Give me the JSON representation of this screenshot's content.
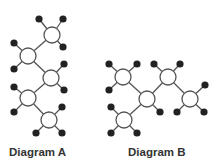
{
  "colors": {
    "background": "#ffffff",
    "edge": "#555555",
    "hub_stroke": "#555555",
    "hub_fill": "#ffffff",
    "leaf_fill": "#222222",
    "label": "#333333"
  },
  "diagrams": [
    {
      "label": "Diagram A",
      "hubs": [
        {
          "x": 52,
          "y": 35
        },
        {
          "x": 28,
          "y": 56
        },
        {
          "x": 51,
          "y": 78
        },
        {
          "x": 28,
          "y": 98
        },
        {
          "x": 49,
          "y": 120
        }
      ],
      "hub_edges": [
        [
          0,
          1
        ],
        [
          1,
          2
        ],
        [
          2,
          3
        ],
        [
          3,
          4
        ]
      ],
      "leaves": [
        {
          "hub": 0,
          "x": 39,
          "y": 19
        },
        {
          "hub": 0,
          "x": 63,
          "y": 19
        },
        {
          "hub": 0,
          "x": 63,
          "y": 47
        },
        {
          "hub": 1,
          "x": 14,
          "y": 43
        },
        {
          "hub": 1,
          "x": 14,
          "y": 69
        },
        {
          "hub": 2,
          "x": 64,
          "y": 64
        },
        {
          "hub": 2,
          "x": 64,
          "y": 90
        },
        {
          "hub": 3,
          "x": 14,
          "y": 87
        },
        {
          "hub": 3,
          "x": 14,
          "y": 112
        },
        {
          "hub": 4,
          "x": 62,
          "y": 107
        },
        {
          "hub": 4,
          "x": 36,
          "y": 133
        },
        {
          "hub": 4,
          "x": 62,
          "y": 133
        }
      ]
    },
    {
      "label": "Diagram B",
      "hubs": [
        {
          "x": 123,
          "y": 77
        },
        {
          "x": 147,
          "y": 99
        },
        {
          "x": 168,
          "y": 77
        },
        {
          "x": 190,
          "y": 99
        },
        {
          "x": 124,
          "y": 120
        }
      ],
      "hub_edges": [
        [
          0,
          1
        ],
        [
          1,
          2
        ],
        [
          2,
          3
        ],
        [
          1,
          4
        ]
      ],
      "leaves": [
        {
          "hub": 0,
          "x": 109,
          "y": 64
        },
        {
          "hub": 0,
          "x": 137,
          "y": 64
        },
        {
          "hub": 0,
          "x": 109,
          "y": 90
        },
        {
          "hub": 2,
          "x": 154,
          "y": 64
        },
        {
          "hub": 2,
          "x": 180,
          "y": 64
        },
        {
          "hub": 1,
          "x": 160,
          "y": 112
        },
        {
          "hub": 3,
          "x": 205,
          "y": 85
        },
        {
          "hub": 3,
          "x": 177,
          "y": 112
        },
        {
          "hub": 3,
          "x": 204,
          "y": 112
        },
        {
          "hub": 4,
          "x": 111,
          "y": 107
        },
        {
          "hub": 4,
          "x": 111,
          "y": 133
        },
        {
          "hub": 4,
          "x": 137,
          "y": 133
        }
      ]
    }
  ]
}
